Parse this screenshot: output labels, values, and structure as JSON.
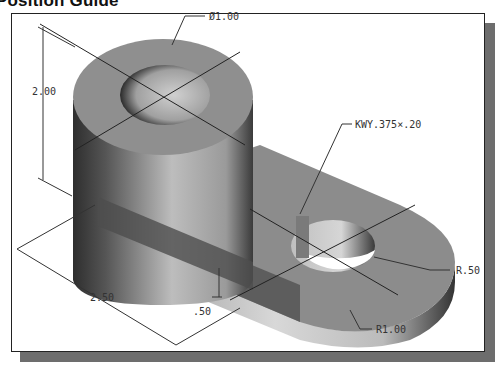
{
  "title": "Position Guide",
  "drawing": {
    "description": "Isometric shaded 3D model of a bracket: vertical hollow cylinder joined to a flat arm with a keyed hole and rounded end",
    "dimensions": {
      "hole_diameter": "Ø1.00",
      "height": "2.00",
      "keyway": "KWY.375×.20",
      "hole_radius": "R.50",
      "end_radius": "R1.00",
      "length": "2.50",
      "arm_thickness": ".50"
    }
  },
  "colors": {
    "frame_border": "#222222",
    "shadow": "#6d6d6d",
    "part_top": "#8a8a8a",
    "part_dark": "#3a3a3a"
  }
}
